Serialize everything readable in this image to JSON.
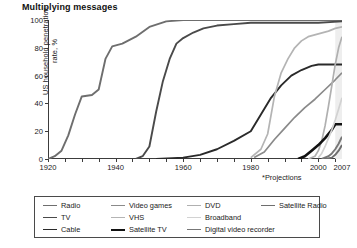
{
  "title": "Multiplying messages",
  "footnote": "*Projections",
  "axes": {
    "ylabel": "US household penetration rate, %",
    "yticks": [
      "0",
      "20",
      "40",
      "60",
      "80",
      "100"
    ],
    "xticks": [
      "1920",
      "1940",
      "1960",
      "1980",
      "2000",
      "2007"
    ]
  },
  "projection_marker": "*",
  "legend": {
    "items": [
      {
        "label": "Radio",
        "color": "#6e6e6e",
        "width": 1.9,
        "col": 0,
        "row": 0
      },
      {
        "label": "TV",
        "color": "#4a4a4a",
        "width": 1.9,
        "col": 0,
        "row": 1
      },
      {
        "label": "Cable",
        "color": "#2a2a2a",
        "width": 1.9,
        "col": 0,
        "row": 2
      },
      {
        "label": "Video games",
        "color": "#8a8a8a",
        "width": 1.7,
        "col": 1,
        "row": 0
      },
      {
        "label": "VHS",
        "color": "#b4b4b4",
        "width": 1.7,
        "col": 1,
        "row": 1
      },
      {
        "label": "Satellite TV",
        "color": "#121212",
        "width": 2.6,
        "col": 1,
        "row": 2
      },
      {
        "label": "DVD",
        "color": "#b0b0b0",
        "width": 1.7,
        "col": 2,
        "row": 0
      },
      {
        "label": "Broadband",
        "color": "#d2d2d2",
        "width": 1.7,
        "col": 2,
        "row": 1
      },
      {
        "label": "Digital video recorder",
        "color": "#777777",
        "width": 1.9,
        "col": 2,
        "row": 2
      },
      {
        "label": "Satellite Radio",
        "color": "#6e6e6e",
        "width": 1.9,
        "col": 3,
        "row": 0
      }
    ]
  },
  "chart_data": {
    "type": "line",
    "title": "Multiplying messages",
    "xlabel": "",
    "ylabel": "US household penetration rate, %",
    "xlim": [
      1920,
      2007
    ],
    "ylim": [
      0,
      100
    ],
    "grid": false,
    "legend_position": "bottom",
    "annotations": [
      "*Projections"
    ],
    "projection_band": [
      2005,
      2007
    ],
    "series": [
      {
        "name": "Radio",
        "color": "#6e6e6e",
        "points": [
          [
            1920,
            0
          ],
          [
            1922,
            2
          ],
          [
            1924,
            6
          ],
          [
            1926,
            17
          ],
          [
            1928,
            32
          ],
          [
            1930,
            45
          ],
          [
            1933,
            46
          ],
          [
            1935,
            50
          ],
          [
            1937,
            72
          ],
          [
            1939,
            81
          ],
          [
            1942,
            83
          ],
          [
            1946,
            88
          ],
          [
            1950,
            95
          ],
          [
            1955,
            99
          ],
          [
            1960,
            100
          ],
          [
            1970,
            100
          ],
          [
            1980,
            100
          ],
          [
            1990,
            100
          ],
          [
            2000,
            100
          ],
          [
            2007,
            100
          ]
        ]
      },
      {
        "name": "TV",
        "color": "#4a4a4a",
        "points": [
          [
            1946,
            0
          ],
          [
            1948,
            2
          ],
          [
            1950,
            9
          ],
          [
            1952,
            34
          ],
          [
            1954,
            56
          ],
          [
            1956,
            72
          ],
          [
            1958,
            83
          ],
          [
            1960,
            87
          ],
          [
            1963,
            91
          ],
          [
            1966,
            94
          ],
          [
            1970,
            96
          ],
          [
            1975,
            97
          ],
          [
            1980,
            98
          ],
          [
            1990,
            98
          ],
          [
            2000,
            98
          ],
          [
            2007,
            99
          ]
        ]
      },
      {
        "name": "Cable",
        "color": "#2a2a2a",
        "points": [
          [
            1952,
            0
          ],
          [
            1960,
            1
          ],
          [
            1965,
            3
          ],
          [
            1970,
            7
          ],
          [
            1975,
            13
          ],
          [
            1980,
            20
          ],
          [
            1983,
            32
          ],
          [
            1986,
            44
          ],
          [
            1989,
            53
          ],
          [
            1992,
            60
          ],
          [
            1995,
            64
          ],
          [
            1998,
            67
          ],
          [
            2000,
            68
          ],
          [
            2003,
            68
          ],
          [
            2005,
            68
          ],
          [
            2007,
            68
          ]
        ]
      },
      {
        "name": "VHS",
        "color": "#b4b4b4",
        "points": [
          [
            1980,
            1
          ],
          [
            1983,
            7
          ],
          [
            1985,
            18
          ],
          [
            1987,
            45
          ],
          [
            1989,
            62
          ],
          [
            1991,
            72
          ],
          [
            1993,
            80
          ],
          [
            1995,
            85
          ],
          [
            1997,
            88
          ],
          [
            2000,
            90
          ],
          [
            2003,
            92
          ],
          [
            2005,
            94
          ],
          [
            2007,
            95
          ]
        ]
      },
      {
        "name": "Video games",
        "color": "#8a8a8a",
        "points": [
          [
            1981,
            1
          ],
          [
            1984,
            5
          ],
          [
            1987,
            14
          ],
          [
            1990,
            22
          ],
          [
            1993,
            30
          ],
          [
            1996,
            37
          ],
          [
            1999,
            43
          ],
          [
            2002,
            50
          ],
          [
            2005,
            57
          ],
          [
            2007,
            62
          ]
        ]
      },
      {
        "name": "DVD",
        "color": "#b0b0b0",
        "points": [
          [
            1997,
            0
          ],
          [
            1999,
            2
          ],
          [
            2000,
            6
          ],
          [
            2001,
            13
          ],
          [
            2002,
            24
          ],
          [
            2003,
            38
          ],
          [
            2004,
            53
          ],
          [
            2005,
            68
          ],
          [
            2006,
            80
          ],
          [
            2007,
            88
          ]
        ]
      },
      {
        "name": "Satellite TV",
        "color": "#121212",
        "points": [
          [
            1994,
            0
          ],
          [
            1996,
            2
          ],
          [
            1998,
            6
          ],
          [
            2000,
            10
          ],
          [
            2002,
            15
          ],
          [
            2004,
            21
          ],
          [
            2005,
            25
          ],
          [
            2006,
            25
          ],
          [
            2007,
            25
          ]
        ]
      },
      {
        "name": "Broadband",
        "color": "#d2d2d2",
        "points": [
          [
            2000,
            1
          ],
          [
            2001,
            4
          ],
          [
            2002,
            9
          ],
          [
            2003,
            15
          ],
          [
            2004,
            21
          ],
          [
            2005,
            28
          ],
          [
            2006,
            36
          ],
          [
            2007,
            44
          ]
        ]
      },
      {
        "name": "Digital video recorder",
        "color": "#777777",
        "points": [
          [
            2001,
            0
          ],
          [
            2003,
            2
          ],
          [
            2004,
            4
          ],
          [
            2005,
            7
          ],
          [
            2006,
            11
          ],
          [
            2007,
            16
          ]
        ]
      },
      {
        "name": "Satellite Radio",
        "color": "#6e6e6e",
        "points": [
          [
            2002,
            0
          ],
          [
            2004,
            1
          ],
          [
            2005,
            3
          ],
          [
            2006,
            6
          ],
          [
            2007,
            10
          ]
        ]
      }
    ]
  }
}
